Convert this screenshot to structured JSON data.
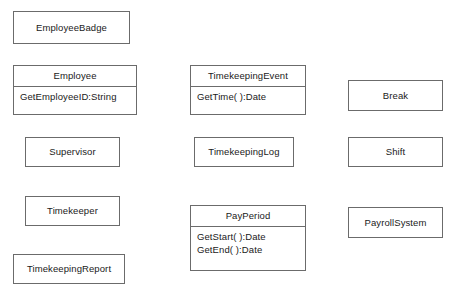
{
  "diagram": {
    "type": "uml-class-diagram",
    "background_color": "#ffffff",
    "border_color": "#6b6b6b",
    "text_color": "#1a1a1a",
    "classes": [
      {
        "id": "employee-badge",
        "name": "EmployeeBadge",
        "members": [],
        "x": 13,
        "y": 11,
        "width": 117,
        "height": 33
      },
      {
        "id": "employee",
        "name": "Employee",
        "members": [
          "GetEmployeeID:String"
        ],
        "x": 13,
        "y": 65,
        "width": 124,
        "height": 50
      },
      {
        "id": "timekeeping-event",
        "name": "TimekeepingEvent",
        "members": [
          "GetTime( ):Date"
        ],
        "x": 190,
        "y": 65,
        "width": 116,
        "height": 50
      },
      {
        "id": "break",
        "name": "Break",
        "members": [],
        "x": 348,
        "y": 80,
        "width": 95,
        "height": 31
      },
      {
        "id": "supervisor",
        "name": "Supervisor",
        "members": [],
        "x": 25,
        "y": 137,
        "width": 95,
        "height": 30
      },
      {
        "id": "timekeeping-log",
        "name": "TimekeepingLog",
        "members": [],
        "x": 194,
        "y": 137,
        "width": 100,
        "height": 30
      },
      {
        "id": "shift",
        "name": "Shift",
        "members": [],
        "x": 348,
        "y": 137,
        "width": 95,
        "height": 30
      },
      {
        "id": "timekeeper",
        "name": "Timekeeper",
        "members": [],
        "x": 25,
        "y": 196,
        "width": 95,
        "height": 30
      },
      {
        "id": "pay-period",
        "name": "PayPeriod",
        "members": [
          "GetStart( ):Date",
          "GetEnd( ):Date"
        ],
        "x": 190,
        "y": 205,
        "width": 116,
        "height": 66
      },
      {
        "id": "payroll-system",
        "name": "PayrollSystem",
        "members": [],
        "x": 348,
        "y": 207,
        "width": 95,
        "height": 31
      },
      {
        "id": "timekeeping-report",
        "name": "TimekeepingReport",
        "members": [],
        "x": 13,
        "y": 254,
        "width": 112,
        "height": 30
      }
    ]
  }
}
